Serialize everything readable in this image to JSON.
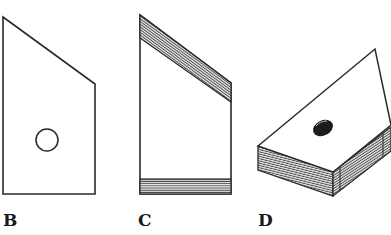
{
  "figure": {
    "panels": [
      {
        "id": "B",
        "label": "B",
        "view": "flat front face with round sound hole"
      },
      {
        "id": "C",
        "label": "C",
        "view": "face showing hatched top and bottom end blocks"
      },
      {
        "id": "D",
        "label": "D",
        "view": "3D isometric view with hatched sides and dark hole"
      }
    ]
  },
  "colors": {
    "line": "#2a2a2a",
    "hatch": "#555555",
    "hole_fill": "#1c1c1c",
    "background": "#ffffff"
  }
}
